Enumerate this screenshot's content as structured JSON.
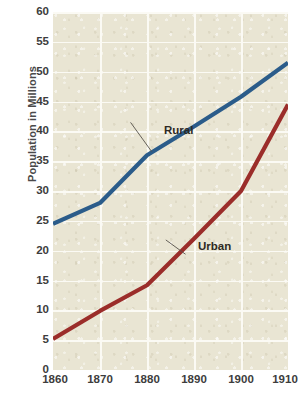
{
  "chart_data": {
    "type": "line",
    "title": "",
    "subtitle": "",
    "xlabel": "",
    "ylabel": "Population in Millions",
    "x": [
      1860,
      1870,
      1880,
      1890,
      1900,
      1910
    ],
    "xtick_labels": [
      "1860",
      "1870",
      "1880",
      "1890",
      "1900",
      "1910"
    ],
    "ytick_labels": [
      "0",
      "5",
      "10",
      "15",
      "20",
      "25",
      "30",
      "35",
      "40",
      "45",
      "50",
      "55",
      "60"
    ],
    "yticks": [
      0,
      5,
      10,
      15,
      20,
      25,
      30,
      35,
      40,
      45,
      50,
      55,
      60
    ],
    "xlim": [
      1860,
      1910
    ],
    "ylim": [
      0,
      60
    ],
    "grid": true,
    "grid_color": "#fbfaf4",
    "plot_background": "#e9e5d3",
    "legend_position": "inline-annotations",
    "series": [
      {
        "name": "Rural",
        "label": "Rural",
        "color": "#2b5c8a",
        "values": [
          24.5,
          28.0,
          36.0,
          40.8,
          45.8,
          51.5
        ],
        "annotation": {
          "text": "Rural",
          "leader_from_x": 1876.5,
          "leader_from_y": 41.5,
          "leader_to_x": 1881.0,
          "leader_to_y": 36.6
        }
      },
      {
        "name": "Urban",
        "label": "Urban",
        "color": "#9b2d2a",
        "values": [
          5.2,
          9.9,
          14.2,
          22.0,
          30.0,
          44.5
        ],
        "annotation": {
          "text": "Urban",
          "leader_from_x": 1884.0,
          "leader_from_y": 21.8,
          "leader_to_x": 1888.2,
          "leader_to_y": 19.4
        }
      }
    ]
  }
}
